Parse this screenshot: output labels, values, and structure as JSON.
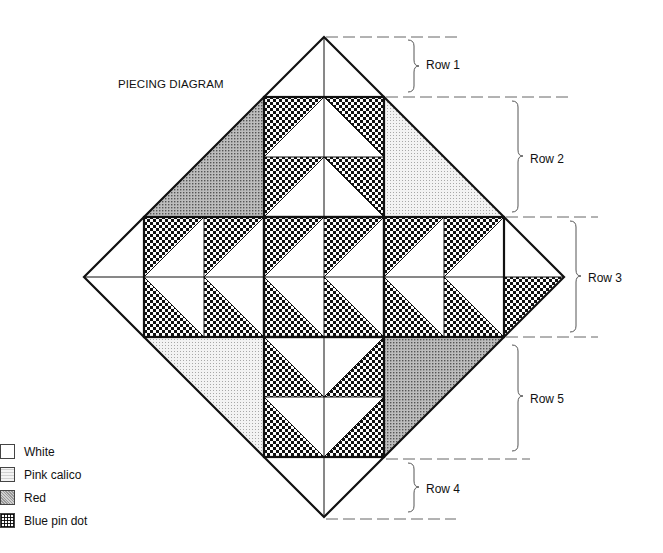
{
  "title": "PIECING DIAGRAM",
  "rows": [
    {
      "label": "Row 1",
      "y": 58
    },
    {
      "label": "Row 2",
      "y": 152
    },
    {
      "label": "Row 3",
      "y": 272
    },
    {
      "label": "Row 5",
      "y": 393
    },
    {
      "label": "Row 4",
      "y": 483
    }
  ],
  "legend": [
    {
      "label": "White",
      "fabric": "white"
    },
    {
      "label": "Pink calico",
      "fabric": "pink"
    },
    {
      "label": "Red",
      "fabric": "red"
    },
    {
      "label": "Blue pin dot",
      "fabric": "blue"
    }
  ],
  "colors": {
    "line": "#111111",
    "dash": "#666666",
    "white": "#ffffff"
  }
}
